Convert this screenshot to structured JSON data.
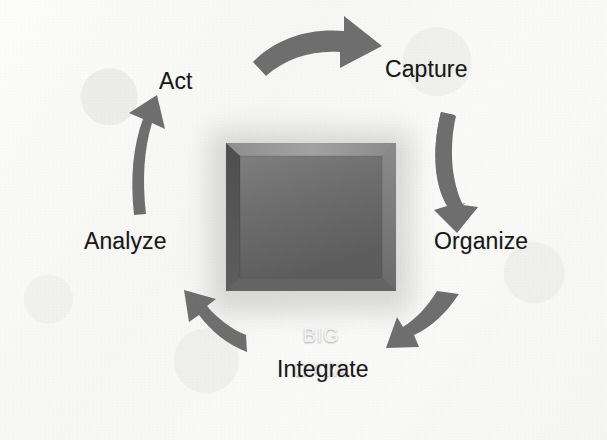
{
  "diagram": {
    "center": {
      "line1": "BIG",
      "line2": "DATA",
      "fill_color": "#6b6b6b",
      "text_color": "#f4f4f4"
    },
    "stages": [
      {
        "id": "act",
        "label": "Act"
      },
      {
        "id": "capture",
        "label": "Capture"
      },
      {
        "id": "organize",
        "label": "Organize"
      },
      {
        "id": "integrate",
        "label": "Integrate"
      },
      {
        "id": "analyze",
        "label": "Analyze"
      }
    ],
    "arrows": [
      {
        "id": "act-to-capture",
        "from": "Act",
        "to": "Capture",
        "direction": "clockwise-top"
      },
      {
        "id": "capture-to-organize",
        "from": "Capture",
        "to": "Organize",
        "direction": "clockwise-right"
      },
      {
        "id": "organize-to-integrate",
        "from": "Organize",
        "to": "Integrate",
        "direction": "clockwise-bottom-right"
      },
      {
        "id": "integrate-to-analyze",
        "from": "Integrate",
        "to": "Analyze",
        "direction": "clockwise-bottom-left"
      },
      {
        "id": "analyze-to-act",
        "from": "Analyze",
        "to": "Act",
        "direction": "clockwise-left"
      }
    ],
    "colors": {
      "arrow": "#6e6e6e",
      "background": "#fafaf8",
      "label_text": "#171717"
    }
  }
}
